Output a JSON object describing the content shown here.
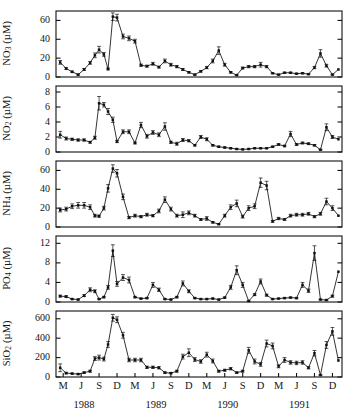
{
  "figure": {
    "type": "multi-panel-time-series",
    "panel_count": 5,
    "background": "#ffffff",
    "line_color": "#111111",
    "marker_color": "#111111"
  },
  "axis": {
    "x": {
      "label": "",
      "tick_labels": [
        "M",
        "J",
        "S",
        "D",
        "M",
        "J",
        "S",
        "D",
        "M",
        "J",
        "S",
        "D",
        "M",
        "J",
        "S",
        "D"
      ],
      "year_labels": [
        "1988",
        "1989",
        "1990",
        "1991"
      ],
      "range_months": [
        2,
        47
      ],
      "tick_months": [
        2,
        5,
        8,
        11,
        14,
        17,
        20,
        23,
        26,
        29,
        32,
        35,
        38,
        41,
        44,
        47
      ]
    }
  },
  "chart_data": [
    {
      "type": "line",
      "title": "",
      "ylabel": "NO3 (µM)",
      "ylabel_base": "NO",
      "ylabel_sub": "3",
      "ylabel_unit": " (µM)",
      "xlabel": "",
      "ylim": [
        0,
        70
      ],
      "yticks": [
        0,
        20,
        40,
        60
      ],
      "ytick_labels": [
        "0",
        "20",
        "40",
        "60"
      ],
      "grid": false,
      "legend": "none",
      "x": [
        1.5,
        2.5,
        3.5,
        4.5,
        5.5,
        6.5,
        7.3,
        8.0,
        8.8,
        9.5,
        10.3,
        11.0,
        12.0,
        13.0,
        14.0,
        15.0,
        16.0,
        17.0,
        18.0,
        19.0,
        20.0,
        21.0,
        22.0,
        23.0,
        24.0,
        25.0,
        26.0,
        27.0,
        28.0,
        29.0,
        30.0,
        31.0,
        32.0,
        33.0,
        34.0,
        35.0,
        36.0,
        37.0,
        38.0,
        39.0,
        40.0,
        41.0,
        42.0,
        43.0,
        44.0,
        45.0,
        46.0,
        47.0
      ],
      "values": [
        15.5,
        9.0,
        5.5,
        2.5,
        8.0,
        15.0,
        23.0,
        29.0,
        24.0,
        8.5,
        64.0,
        63.0,
        43.0,
        41.0,
        38.0,
        12.5,
        11.5,
        14.0,
        10.5,
        17.0,
        13.0,
        11.0,
        8.0,
        5.0,
        2.5,
        6.0,
        10.0,
        17.0,
        28.0,
        13.0,
        5.0,
        2.0,
        9.5,
        11.0,
        11.0,
        13.0,
        11.0,
        4.0,
        2.5,
        4.5,
        4.5,
        3.5,
        4.0,
        3.0,
        10.0,
        25.0,
        12.0,
        2.5
      ],
      "errors": [
        2.0,
        1.0,
        0.8,
        0.6,
        1.0,
        1.5,
        2.5,
        3.5,
        2.0,
        1.0,
        4.0,
        3.5,
        2.5,
        2.5,
        2.0,
        1.2,
        1.0,
        1.5,
        1.0,
        2.0,
        1.5,
        1.2,
        1.0,
        0.8,
        0.6,
        0.8,
        1.2,
        2.0,
        4.0,
        1.5,
        0.8,
        0.5,
        1.0,
        1.2,
        1.2,
        2.5,
        1.2,
        0.6,
        0.5,
        0.6,
        0.6,
        0.5,
        0.6,
        0.5,
        1.2,
        4.0,
        1.5,
        0.5
      ],
      "tail_x": [
        48.0
      ],
      "tail_values": [
        8.0
      ]
    },
    {
      "type": "line",
      "title": "",
      "ylabel": "NO2 (µM)",
      "ylabel_base": "NO",
      "ylabel_sub": "2",
      "ylabel_unit": " (µM)",
      "xlabel": "",
      "ylim": [
        0,
        8.8
      ],
      "yticks": [
        0,
        2,
        4,
        6,
        8
      ],
      "ytick_labels": [
        "0",
        "2",
        "4",
        "6",
        "8"
      ],
      "grid": false,
      "legend": "none",
      "x": [
        1.5,
        2.5,
        3.5,
        4.5,
        5.5,
        6.5,
        7.3,
        8.0,
        8.8,
        9.5,
        10.3,
        11.0,
        12.0,
        13.0,
        14.0,
        15.0,
        16.0,
        17.0,
        18.0,
        19.0,
        20.0,
        21.0,
        22.0,
        23.0,
        24.0,
        25.0,
        26.0,
        27.0,
        28.0,
        29.0,
        30.0,
        31.0,
        32.0,
        33.0,
        34.0,
        35.0,
        36.0,
        37.0,
        38.0,
        39.0,
        40.0,
        41.0,
        42.0,
        43.0,
        44.0,
        45.0,
        46.0,
        47.0
      ],
      "values": [
        2.3,
        1.8,
        1.7,
        1.6,
        1.6,
        1.3,
        1.9,
        6.5,
        6.3,
        5.4,
        4.3,
        1.4,
        2.7,
        2.7,
        1.2,
        3.6,
        2.1,
        2.6,
        2.3,
        3.4,
        1.3,
        1.1,
        1.6,
        1.5,
        0.9,
        2.0,
        1.7,
        0.9,
        0.7,
        0.6,
        0.5,
        0.4,
        0.35,
        0.4,
        0.5,
        0.5,
        0.5,
        0.7,
        1.0,
        0.8,
        2.4,
        1.0,
        1.2,
        1.1,
        0.9,
        0.3,
        3.3,
        2.0
      ],
      "errors": [
        0.45,
        0.2,
        0.15,
        0.15,
        0.15,
        0.12,
        0.2,
        0.9,
        0.3,
        0.4,
        0.35,
        0.15,
        0.25,
        0.25,
        0.12,
        0.35,
        0.25,
        0.25,
        0.25,
        0.5,
        0.15,
        0.2,
        0.2,
        0.15,
        0.1,
        0.2,
        0.2,
        0.1,
        0.08,
        0.08,
        0.06,
        0.05,
        0.05,
        0.05,
        0.06,
        0.06,
        0.06,
        0.08,
        0.12,
        0.1,
        0.35,
        0.12,
        0.12,
        0.12,
        0.1,
        0.05,
        0.45,
        0.2
      ],
      "tail_x": [
        48.0
      ],
      "tail_values": [
        1.7
      ]
    },
    {
      "type": "line",
      "title": "",
      "ylabel": "NH4 (µM)",
      "ylabel_base": "NH",
      "ylabel_sub": "4",
      "ylabel_unit": " (µM)",
      "xlabel": "",
      "ylim": [
        0,
        70
      ],
      "yticks": [
        0,
        20,
        40,
        60
      ],
      "ytick_labels": [
        "0",
        "20",
        "40",
        "60"
      ],
      "grid": false,
      "legend": "none",
      "x": [
        1.5,
        2.5,
        3.5,
        4.5,
        5.5,
        6.5,
        7.3,
        8.0,
        8.8,
        9.5,
        10.3,
        11.0,
        12.0,
        13.0,
        14.0,
        15.0,
        16.0,
        17.0,
        18.0,
        19.0,
        20.0,
        21.0,
        22.0,
        23.0,
        24.0,
        25.0,
        26.0,
        27.0,
        28.0,
        29.0,
        30.0,
        31.0,
        32.0,
        33.0,
        34.0,
        35.0,
        36.0,
        37.0,
        38.0,
        39.0,
        40.0,
        41.0,
        42.0,
        43.0,
        44.0,
        45.0,
        46.0,
        47.0
      ],
      "values": [
        18.0,
        19.0,
        22.0,
        23.0,
        23.0,
        21.0,
        12.0,
        11.5,
        20.0,
        41.0,
        62.0,
        57.0,
        32.0,
        10.0,
        12.0,
        11.0,
        13.0,
        12.0,
        17.0,
        29.0,
        19.0,
        12.0,
        13.0,
        15.0,
        12.0,
        8.0,
        9.0,
        5.0,
        3.0,
        12.0,
        21.0,
        25.0,
        11.0,
        20.0,
        22.0,
        47.0,
        44.0,
        6.0,
        9.0,
        8.0,
        12.0,
        13.0,
        13.0,
        14.0,
        11.0,
        14.0,
        27.0,
        20.0
      ],
      "errors": [
        2.0,
        2.0,
        2.5,
        3.0,
        3.0,
        2.5,
        1.5,
        1.2,
        2.0,
        4.0,
        4.0,
        4.0,
        3.0,
        1.2,
        1.5,
        1.2,
        1.5,
        1.2,
        2.0,
        3.0,
        2.0,
        1.5,
        3.0,
        2.0,
        1.5,
        1.0,
        2.0,
        0.8,
        0.5,
        1.5,
        2.5,
        3.5,
        1.5,
        2.5,
        2.5,
        5.0,
        4.5,
        1.0,
        1.2,
        1.0,
        1.5,
        1.5,
        1.5,
        1.5,
        1.2,
        1.5,
        3.5,
        2.5
      ],
      "tail_x": [
        48.0
      ],
      "tail_values": [
        12.0
      ]
    },
    {
      "type": "line",
      "title": "",
      "ylabel": "PO4 (µM)",
      "ylabel_base": "PO",
      "ylabel_sub": "4",
      "ylabel_unit": " (µM)",
      "xlabel": "",
      "ylim": [
        0,
        13.5
      ],
      "yticks": [
        0,
        4,
        8,
        12
      ],
      "ytick_labels": [
        "0",
        "4",
        "8",
        "12"
      ],
      "grid": false,
      "legend": "none",
      "x": [
        1.5,
        2.5,
        3.5,
        4.5,
        5.5,
        6.5,
        7.3,
        8.0,
        8.8,
        9.5,
        10.3,
        11.0,
        12.0,
        13.0,
        14.0,
        15.0,
        16.0,
        17.0,
        18.0,
        19.0,
        20.0,
        21.0,
        22.0,
        23.0,
        24.0,
        25.0,
        26.0,
        27.0,
        28.0,
        29.0,
        30.0,
        31.0,
        32.0,
        33.0,
        34.0,
        35.0,
        36.0,
        37.0,
        38.0,
        39.0,
        40.0,
        41.0,
        42.0,
        43.0,
        44.0,
        45.0,
        46.0,
        47.0
      ],
      "values": [
        1.2,
        1.1,
        0.6,
        0.5,
        1.3,
        2.5,
        2.2,
        0.6,
        1.0,
        3.0,
        10.5,
        3.7,
        5.0,
        4.5,
        1.0,
        0.7,
        0.8,
        3.5,
        2.5,
        0.6,
        0.5,
        1.0,
        3.8,
        2.2,
        0.8,
        0.6,
        0.6,
        0.7,
        0.5,
        0.9,
        3.0,
        6.5,
        3.5,
        0.2,
        1.5,
        4.2,
        1.4,
        0.6,
        0.7,
        0.8,
        0.9,
        0.8,
        3.5,
        2.3,
        10.0,
        0.5,
        0.4,
        1.2
      ],
      "errors": [
        0.2,
        0.2,
        0.1,
        0.1,
        0.2,
        0.4,
        0.3,
        0.1,
        0.15,
        0.4,
        1.2,
        0.5,
        0.6,
        0.6,
        0.15,
        0.1,
        0.12,
        0.5,
        0.35,
        0.1,
        0.08,
        0.15,
        0.5,
        0.3,
        0.12,
        0.1,
        0.1,
        0.1,
        0.08,
        0.12,
        0.4,
        0.9,
        0.5,
        0.05,
        0.2,
        0.5,
        0.2,
        0.1,
        0.1,
        0.12,
        0.12,
        0.12,
        0.5,
        0.35,
        1.5,
        0.08,
        0.06,
        0.2
      ],
      "tail_x": [
        48.0
      ],
      "tail_values": [
        6.2
      ]
    },
    {
      "type": "line",
      "title": "",
      "ylabel": "SiO2 (µM)",
      "ylabel_base": "SiO",
      "ylabel_sub": "2",
      "ylabel_unit": " (µM)",
      "xlabel": "",
      "ylim": [
        0,
        680
      ],
      "yticks": [
        0,
        200,
        400,
        600
      ],
      "ytick_labels": [
        "0",
        "200",
        "400",
        "600"
      ],
      "grid": false,
      "legend": "none",
      "x": [
        1.5,
        2.5,
        3.5,
        4.5,
        5.5,
        6.5,
        7.3,
        8.0,
        8.8,
        9.5,
        10.3,
        11.0,
        12.0,
        13.0,
        14.0,
        15.0,
        16.0,
        17.0,
        18.0,
        19.0,
        20.0,
        21.0,
        22.0,
        23.0,
        24.0,
        25.0,
        26.0,
        27.0,
        28.0,
        29.0,
        30.0,
        31.0,
        32.0,
        33.0,
        34.0,
        35.0,
        36.0,
        37.0,
        38.0,
        39.0,
        40.0,
        41.0,
        42.0,
        43.0,
        44.0,
        45.0,
        46.0,
        47.0
      ],
      "values": [
        95,
        40,
        35,
        30,
        45,
        60,
        190,
        200,
        185,
        335,
        610,
        590,
        430,
        175,
        175,
        175,
        100,
        100,
        95,
        45,
        40,
        60,
        210,
        250,
        180,
        160,
        230,
        165,
        60,
        70,
        85,
        45,
        60,
        275,
        160,
        130,
        345,
        320,
        110,
        175,
        150,
        145,
        150,
        95,
        245,
        20,
        330,
        470
      ],
      "errors": [
        40,
        8,
        6,
        5,
        8,
        10,
        20,
        25,
        20,
        30,
        35,
        30,
        30,
        18,
        18,
        18,
        12,
        12,
        12,
        8,
        6,
        10,
        25,
        40,
        20,
        18,
        25,
        20,
        10,
        10,
        12,
        8,
        10,
        30,
        25,
        20,
        35,
        30,
        15,
        25,
        18,
        18,
        18,
        12,
        28,
        5,
        35,
        40
      ],
      "tail_x": [
        48.0
      ],
      "tail_values": [
        170
      ]
    }
  ]
}
